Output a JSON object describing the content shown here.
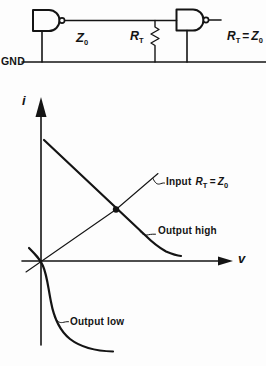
{
  "figure": {
    "circuit": {
      "gnd": "GND",
      "z0": {
        "base": "Z",
        "sub": "0"
      },
      "rt": {
        "base": "R",
        "sub": "T"
      },
      "rt_eq": {
        "lhs": "R",
        "lhs_sub": "T",
        "op": "=",
        "rhs": "Z",
        "rhs_sub": "0"
      }
    },
    "graph": {
      "y_axis": "i",
      "x_axis": "v",
      "input_line": {
        "prefix": "Input",
        "var": "R",
        "var_sub": "T",
        "op": "=",
        "val": "Z",
        "val_sub": "0"
      },
      "output_high": "Output high",
      "output_low": "Output low"
    }
  }
}
